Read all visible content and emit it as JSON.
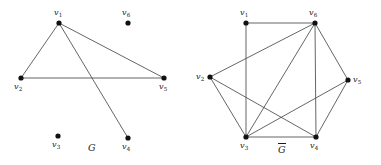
{
  "figure": {
    "caption_left": "G",
    "caption_right": "G",
    "right_has_overline": true,
    "background_color": "#ffffff",
    "edge_color": "#4a4a4a",
    "vertex_color": "#111111"
  },
  "graphs": [
    {
      "id": "graph-g",
      "name": "G",
      "label_text": "G",
      "label_x": 88,
      "label_y": 143,
      "overline": false,
      "vertices": [
        {
          "id": "v1",
          "label": "v",
          "sub": "1",
          "x": 59,
          "y": 23,
          "label_x": 54,
          "label_y": 9
        },
        {
          "id": "v2",
          "label": "v",
          "sub": "2",
          "x": 21,
          "y": 78,
          "label_x": 14,
          "label_y": 83
        },
        {
          "id": "v3",
          "label": "v",
          "sub": "3",
          "x": 58,
          "y": 136,
          "label_x": 52,
          "label_y": 141
        },
        {
          "id": "v4",
          "label": "v",
          "sub": "4",
          "x": 128,
          "y": 138,
          "label_x": 122,
          "label_y": 143
        },
        {
          "id": "v5",
          "label": "v",
          "sub": "5",
          "x": 164,
          "y": 78,
          "label_x": 159,
          "label_y": 83
        },
        {
          "id": "v6",
          "label": "v",
          "sub": "6",
          "x": 128,
          "y": 23,
          "label_x": 122,
          "label_y": 9
        }
      ],
      "edges": [
        {
          "from": "v1",
          "to": "v2"
        },
        {
          "from": "v1",
          "to": "v4"
        },
        {
          "from": "v1",
          "to": "v5"
        },
        {
          "from": "v2",
          "to": "v5"
        }
      ]
    },
    {
      "id": "graph-g-complement",
      "name": "G-complement",
      "label_text": "G",
      "label_x": 278,
      "label_y": 143,
      "overline": true,
      "vertices": [
        {
          "id": "v1",
          "label": "v",
          "sub": "1",
          "x": 246,
          "y": 23,
          "label_x": 240,
          "label_y": 9
        },
        {
          "id": "v2",
          "label": "v",
          "sub": "2",
          "x": 210,
          "y": 77,
          "label_x": 196,
          "label_y": 73
        },
        {
          "id": "v3",
          "label": "v",
          "sub": "3",
          "x": 246,
          "y": 137,
          "label_x": 240,
          "label_y": 142
        },
        {
          "id": "v4",
          "label": "v",
          "sub": "4",
          "x": 316,
          "y": 137,
          "label_x": 310,
          "label_y": 142
        },
        {
          "id": "v5",
          "label": "v",
          "sub": "5",
          "x": 348,
          "y": 80,
          "label_x": 353,
          "label_y": 76
        },
        {
          "id": "v6",
          "label": "v",
          "sub": "6",
          "x": 315,
          "y": 23,
          "label_x": 309,
          "label_y": 9
        }
      ],
      "edges": [
        {
          "from": "v1",
          "to": "v6"
        },
        {
          "from": "v1",
          "to": "v3"
        },
        {
          "from": "v2",
          "to": "v6"
        },
        {
          "from": "v2",
          "to": "v3"
        },
        {
          "from": "v2",
          "to": "v4"
        },
        {
          "from": "v3",
          "to": "v4"
        },
        {
          "from": "v3",
          "to": "v5"
        },
        {
          "from": "v3",
          "to": "v6"
        },
        {
          "from": "v4",
          "to": "v5"
        },
        {
          "from": "v4",
          "to": "v6"
        },
        {
          "from": "v5",
          "to": "v6"
        }
      ]
    }
  ]
}
